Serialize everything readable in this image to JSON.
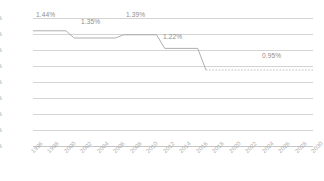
{
  "chart_data": {
    "type": "line",
    "title": "",
    "subtitle": "",
    "xlabel": "",
    "ylabel": "",
    "grid": true,
    "legend": false,
    "ylim": [
      0.0,
      1.6
    ],
    "ytick_labels": [
      "1.6%",
      "1.4%",
      "1.2%",
      "1.0%",
      "0.8%",
      "0.6%",
      "0.4%",
      "0.2%",
      "0.0%"
    ],
    "ytick_values": [
      1.6,
      1.4,
      1.2,
      1.0,
      0.8,
      0.6,
      0.4,
      0.2,
      0.0
    ],
    "xlim": [
      1996,
      2030
    ],
    "categories": [
      "1996",
      "1998",
      "2000",
      "2002",
      "2004",
      "2006",
      "2008",
      "2010",
      "2012",
      "2014",
      "2016",
      "2018",
      "2020",
      "2022",
      "2024",
      "2026",
      "2028",
      "2030"
    ],
    "series": [
      {
        "name": "historical",
        "style": "solid",
        "color": "#a6a6a6",
        "x": [
          1996,
          2000,
          2001,
          2006,
          2007,
          2011,
          2012,
          2016,
          2017
        ],
        "values": [
          1.44,
          1.44,
          1.35,
          1.35,
          1.39,
          1.39,
          1.22,
          1.22,
          0.95
        ]
      },
      {
        "name": "projection",
        "style": "dashed",
        "color": "#b8b8b8",
        "x": [
          2017,
          2030
        ],
        "values": [
          0.95,
          0.95
        ]
      }
    ],
    "data_labels": [
      {
        "text": "1.44%",
        "value": 1.44,
        "x": 1997
      },
      {
        "text": "1.35%",
        "value": 1.35,
        "x": 2002
      },
      {
        "text": "1.39%",
        "value": 1.39,
        "x": 2008
      },
      {
        "text": "1.22%",
        "value": 1.22,
        "x": 2013
      },
      {
        "text": "0.95%",
        "value": 0.95,
        "x": 2026
      }
    ],
    "colors": {
      "line": "#a6a6a6",
      "projection_line": "#b8b8b8",
      "grid": "#d4d4d4",
      "axis": "#c6c6c6",
      "tick_text": "#aeaeae",
      "data_label_text": "#8e8e8e",
      "background": "#ffffff"
    }
  }
}
